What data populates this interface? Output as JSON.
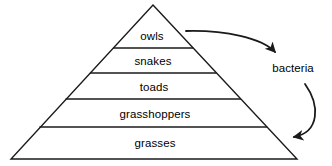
{
  "diagram": {
    "type": "energy-pyramid",
    "title": "",
    "stroke_color": "#1a1a1a",
    "background_color": "#ffffff",
    "pyramid": {
      "apex": {
        "x": 153,
        "y": 5
      },
      "base_left": {
        "x": 11,
        "y": 159
      },
      "base_right": {
        "x": 297,
        "y": 159
      },
      "levels": [
        {
          "name": "owls",
          "label": "owls",
          "label_x": 152,
          "label_y": 36,
          "rank": 5
        },
        {
          "name": "snakes",
          "label": "snakes",
          "label_x": 153,
          "label_y": 61,
          "rank": 4
        },
        {
          "name": "toads",
          "label": "toads",
          "label_x": 154,
          "label_y": 87,
          "rank": 3
        },
        {
          "name": "grasshoppers",
          "label": "grasshoppers",
          "label_x": 155,
          "label_y": 114,
          "rank": 2
        },
        {
          "name": "grasses",
          "label": "grasses",
          "label_x": 155,
          "label_y": 143,
          "rank": 1
        }
      ],
      "divider_y": [
        48,
        73,
        99,
        127
      ]
    },
    "side": {
      "label": "bacteria",
      "label_x": 293,
      "label_y": 68
    },
    "arrows": [
      {
        "name": "owls-to-bacteria",
        "from": "owls",
        "to": "bacteria",
        "path": "M 186 31 C 225 30, 262 38, 275 52"
      },
      {
        "name": "bacteria-to-grasses",
        "from": "bacteria",
        "to": "grasses",
        "path": "M 305 84 C 320 105, 320 132, 294 137"
      }
    ]
  }
}
